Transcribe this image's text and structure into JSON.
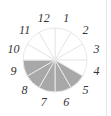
{
  "diagram": {
    "type": "fraction-circle",
    "total_sectors": 12,
    "labels": [
      "1",
      "2",
      "3",
      "4",
      "5",
      "6",
      "7",
      "8",
      "9",
      "10",
      "11",
      "12"
    ],
    "shaded_sectors": [
      5,
      6,
      7,
      8,
      9
    ],
    "shaded_fraction": "5/12",
    "colors": {
      "shaded": "#a8a8a8",
      "unshaded": "#ffffff",
      "divider": "#e8e8e8",
      "label": "#333333"
    },
    "center": [
      55,
      60
    ],
    "radius": 32
  }
}
